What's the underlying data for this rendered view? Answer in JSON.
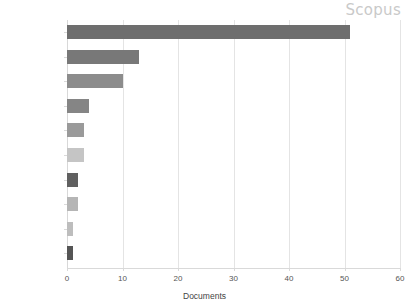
{
  "watermark": {
    "label": "Scopus",
    "color": "#c9c9c9"
  },
  "chart_data": {
    "type": "bar",
    "orientation": "horizontal",
    "title": "",
    "xlabel": "Documents",
    "ylabel": "",
    "xlim": [
      0,
      60
    ],
    "xticks": [
      0,
      10,
      20,
      30,
      40,
      50,
      60
    ],
    "grid": true,
    "legend": false,
    "categories": [
      "South Africa",
      "United States",
      "United Kingdom",
      "Netherlands",
      "Australia",
      "Norway",
      "Denmark",
      "Sweden",
      "Brazil",
      "Canada"
    ],
    "values": [
      51,
      13,
      10,
      4,
      3,
      3,
      2,
      2,
      1,
      1
    ],
    "bar_colors": [
      "#6e6e6e",
      "#787878",
      "#8c8c8c",
      "#858585",
      "#9a9a9a",
      "#c5c5c5",
      "#606060",
      "#b5b5b5",
      "#bdbdbd",
      "#555555"
    ]
  }
}
